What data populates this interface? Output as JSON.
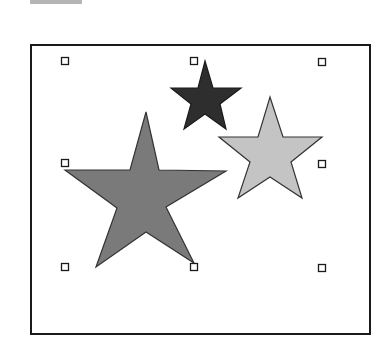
{
  "canvas": {
    "top_bar_color": "#b5b5b5",
    "frame_border_color": "#1a1a1a"
  },
  "shapes": [
    {
      "name": "large-star",
      "fill": "#7a7a7a",
      "stroke": "#333333",
      "points": "146,112 159,170 226,171 166,207 194,263 146,232 96,267 117,208 65,170 130,170"
    },
    {
      "name": "small-dark-star",
      "fill": "#2e2e2e",
      "stroke": "#1a1a1a",
      "points": "205,61 213,88 241,88 220,104 226,129 205,114 184,129 191,104 171,88 198,88"
    },
    {
      "name": "medium-light-star",
      "fill": "#c4c4c4",
      "stroke": "#333333",
      "points": "270,97 283,137 322,137 291,162 302,198 270,177 238,198 250,162 219,137 258,137"
    }
  ],
  "selection_handles": [
    {
      "x": 65,
      "y": 61
    },
    {
      "x": 194,
      "y": 61
    },
    {
      "x": 322,
      "y": 62
    },
    {
      "x": 65,
      "y": 163
    },
    {
      "x": 322,
      "y": 164
    },
    {
      "x": 65,
      "y": 267
    },
    {
      "x": 194,
      "y": 267
    },
    {
      "x": 322,
      "y": 268
    }
  ]
}
